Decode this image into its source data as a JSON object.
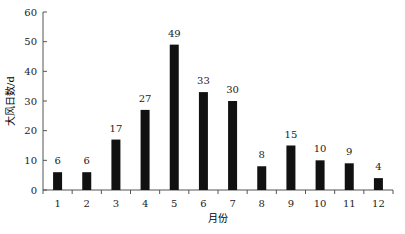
{
  "chart_data": {
    "type": "bar",
    "title": "",
    "xlabel": "月份",
    "ylabel": "大风日数/d",
    "categories": [
      "1",
      "2",
      "3",
      "4",
      "5",
      "6",
      "7",
      "8",
      "9",
      "10",
      "11",
      "12"
    ],
    "values": [
      6,
      6,
      17,
      27,
      49,
      33,
      30,
      8,
      15,
      10,
      9,
      4
    ],
    "ylim": [
      0,
      60
    ],
    "yticks": [
      0,
      10,
      20,
      30,
      40,
      50,
      60
    ],
    "grid": false,
    "bar_color": "#111111"
  }
}
